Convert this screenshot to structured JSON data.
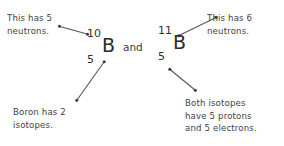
{
  "diagram": {
    "background_color": "#ffffff",
    "text_color": "#3f3f3f",
    "connector_color": "#555555",
    "conjunction": "and",
    "isotopes": [
      {
        "id": "b10",
        "mass_number": "10",
        "symbol": "B",
        "atomic_number": "5"
      },
      {
        "id": "b11",
        "mass_number": "11",
        "symbol": "B",
        "atomic_number": "5"
      }
    ],
    "annotations": [
      {
        "id": "left-top",
        "line1": "This has 5",
        "line2": "neutrons."
      },
      {
        "id": "right-top",
        "line1": "This has 6",
        "line2": "neutrons."
      },
      {
        "id": "left-bottom",
        "line1": "Boron has 2",
        "line2": "isotopes.",
        "line3": ""
      },
      {
        "id": "right-bottom",
        "line1": "Both isotopes",
        "line2": "have 5 protons",
        "line3": "and 5 electrons."
      }
    ]
  }
}
